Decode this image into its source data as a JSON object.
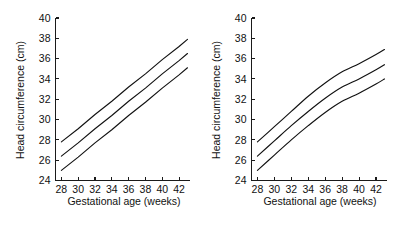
{
  "figure": {
    "background_color": "#ffffff",
    "line_color": "#111111",
    "panel_count": 2
  },
  "chart_data": [
    {
      "type": "line",
      "panel": "left",
      "title": "",
      "xlabel": "Gestational age (weeks)",
      "ylabel": "Head circumference (cm)",
      "xlim": [
        27.3,
        43.3
      ],
      "ylim": [
        24,
        40
      ],
      "xticks": [
        28,
        30,
        32,
        34,
        36,
        38,
        40,
        42
      ],
      "yticks": [
        24,
        26,
        28,
        30,
        32,
        34,
        36,
        38,
        40
      ],
      "xtick_labels": [
        "28",
        "30",
        "32",
        "34",
        "36",
        "38",
        "40",
        "42"
      ],
      "ytick_labels": [
        "24",
        "26",
        "28",
        "30",
        "32",
        "34",
        "36",
        "38",
        "40"
      ],
      "grid": false,
      "legend": "none",
      "x": [
        28,
        30,
        32,
        34,
        36,
        38,
        40,
        42,
        43
      ],
      "series": [
        {
          "name": "upper",
          "values": [
            27.8,
            29.1,
            30.5,
            31.8,
            33.2,
            34.5,
            35.9,
            37.2,
            37.9
          ]
        },
        {
          "name": "mean",
          "values": [
            26.4,
            27.7,
            29.1,
            30.4,
            31.8,
            33.1,
            34.5,
            35.8,
            36.5
          ]
        },
        {
          "name": "lower",
          "values": [
            25.0,
            26.3,
            27.7,
            29.0,
            30.4,
            31.7,
            33.1,
            34.4,
            35.1
          ]
        }
      ]
    },
    {
      "type": "line",
      "panel": "right",
      "title": "",
      "xlabel": "Gestational age (weeks)",
      "ylabel": "Head circumference (cm)",
      "xlim": [
        27.3,
        43.3
      ],
      "ylim": [
        24,
        40
      ],
      "xticks": [
        28,
        30,
        32,
        34,
        36,
        38,
        40,
        42
      ],
      "yticks": [
        24,
        26,
        28,
        30,
        32,
        34,
        36,
        38,
        40
      ],
      "xtick_labels": [
        "28",
        "30",
        "32",
        "34",
        "36",
        "38",
        "40",
        "42"
      ],
      "ytick_labels": [
        "24",
        "26",
        "28",
        "30",
        "32",
        "34",
        "36",
        "38",
        "40"
      ],
      "grid": false,
      "legend": "none",
      "x": [
        28,
        30,
        32,
        34,
        36,
        38,
        40,
        42,
        43
      ],
      "series": [
        {
          "name": "upper",
          "values": [
            27.8,
            29.3,
            30.8,
            32.3,
            33.6,
            34.7,
            35.5,
            36.4,
            36.9
          ]
        },
        {
          "name": "mean",
          "values": [
            26.4,
            27.9,
            29.4,
            30.8,
            32.1,
            33.2,
            34.0,
            34.9,
            35.4
          ]
        },
        {
          "name": "lower",
          "values": [
            25.0,
            26.5,
            28.0,
            29.4,
            30.7,
            31.8,
            32.6,
            33.5,
            34.0
          ]
        }
      ]
    }
  ],
  "left_panel": {
    "x_axis_title": "Gestational age (weeks)",
    "y_axis_title": "Head circumference (cm)",
    "x_tick_labels": [
      "28",
      "30",
      "32",
      "34",
      "36",
      "38",
      "40",
      "42"
    ],
    "y_tick_labels": [
      "24",
      "26",
      "28",
      "30",
      "32",
      "34",
      "36",
      "38",
      "40"
    ]
  },
  "right_panel": {
    "x_axis_title": "Gestational age (weeks)",
    "y_axis_title": "Head circumference (cm)",
    "x_tick_labels": [
      "28",
      "30",
      "32",
      "34",
      "36",
      "38",
      "40",
      "42"
    ],
    "y_tick_labels": [
      "24",
      "26",
      "28",
      "30",
      "32",
      "34",
      "36",
      "38",
      "40"
    ]
  }
}
